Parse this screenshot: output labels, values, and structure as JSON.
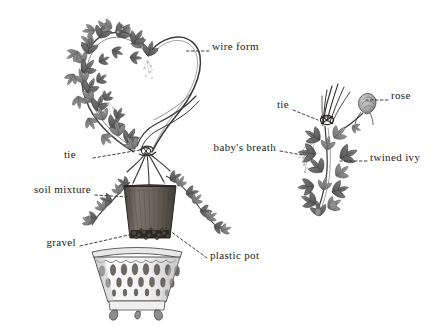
{
  "figure": {
    "background_color": "#ffffff",
    "ink_color": "#3a3a3a",
    "label_color": "#1b1b1b",
    "leader_color": "#2b2b2b"
  },
  "labels": [
    {
      "id": "wire-form",
      "text": "wire form",
      "x": 212,
      "y": 47,
      "align": "left",
      "leader": [
        [
          209,
          51
        ],
        [
          186,
          51
        ]
      ]
    },
    {
      "id": "tie-left",
      "text": "tie",
      "x": 76,
      "y": 155,
      "align": "right",
      "leader": [
        [
          93,
          158
        ],
        [
          140,
          150
        ]
      ]
    },
    {
      "id": "soil-mixture",
      "text": "soil mixture",
      "x": 91,
      "y": 190,
      "align": "right",
      "leader": [
        [
          93,
          195
        ],
        [
          128,
          197
        ]
      ]
    },
    {
      "id": "gravel",
      "text": "gravel",
      "x": 76,
      "y": 243,
      "align": "right",
      "leader": [
        [
          79,
          246
        ],
        [
          133,
          234
        ]
      ]
    },
    {
      "id": "plastic-pot",
      "text": "plastic pot",
      "x": 210,
      "y": 256,
      "align": "left",
      "leader": [
        [
          207,
          258
        ],
        [
          166,
          228
        ]
      ]
    },
    {
      "id": "babys-breath",
      "text": "baby's breath",
      "x": 276,
      "y": 148,
      "align": "right",
      "leader": [
        [
          279,
          151
        ],
        [
          302,
          155
        ]
      ]
    },
    {
      "id": "tie-right",
      "text": "tie",
      "x": 289,
      "y": 105,
      "align": "right",
      "leader": [
        [
          292,
          110
        ],
        [
          318,
          120
        ]
      ]
    },
    {
      "id": "rose",
      "text": "rose",
      "x": 391,
      "y": 96,
      "align": "left",
      "leader": [
        [
          388,
          100
        ],
        [
          366,
          100
        ]
      ]
    },
    {
      "id": "twined-ivy",
      "text": "twined ivy",
      "x": 370,
      "y": 158,
      "align": "left",
      "leader": [
        [
          367,
          161
        ],
        [
          340,
          161
        ]
      ]
    }
  ],
  "elements": {
    "wire_form_note": "heart-shaped wire armature, left lobe clothed in ivy, right lobe bare wire",
    "plastic_pot_note": "dark tapered plastic pot holding soil mixture over gravel layer",
    "cachepot_note": "white ceramic pierced-lattice cachepot on three feet",
    "right_sprig_note": "detail sprig: tied stems, rose bud, twined ivy, baby's breath"
  }
}
